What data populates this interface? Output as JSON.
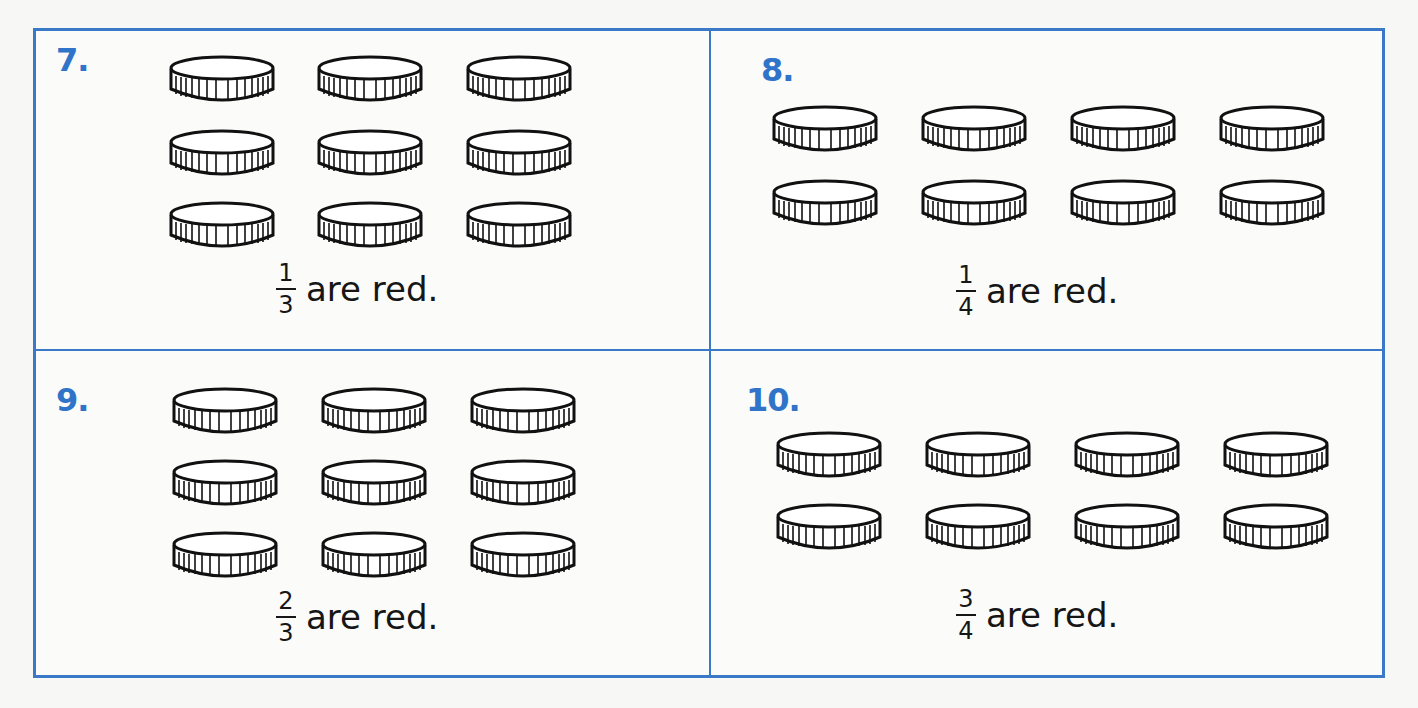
{
  "colors": {
    "accent": "#3a78c8",
    "number": "#2f74c8",
    "ink": "#161616"
  },
  "problems": [
    {
      "number": "7.",
      "rows": 3,
      "cols": 3,
      "coin_count": 9,
      "numerator": "1",
      "denominator": "3",
      "caption": "are red."
    },
    {
      "number": "8.",
      "rows": 2,
      "cols": 4,
      "coin_count": 8,
      "numerator": "1",
      "denominator": "4",
      "caption": "are red."
    },
    {
      "number": "9.",
      "rows": 3,
      "cols": 3,
      "coin_count": 9,
      "numerator": "2",
      "denominator": "3",
      "caption": "are red."
    },
    {
      "number": "10.",
      "rows": 2,
      "cols": 4,
      "coin_count": 8,
      "numerator": "3",
      "denominator": "4",
      "caption": "are red."
    }
  ],
  "coin_icon": "coin-icon"
}
